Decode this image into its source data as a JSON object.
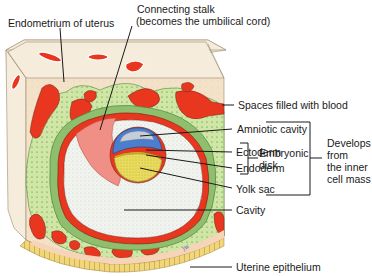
{
  "diagram": {
    "type": "anatomical-cross-section",
    "colors": {
      "endometrium": "#f3e1c8",
      "block_top": "#f5ecdc",
      "blood": "#e8361f",
      "green_light": "#cfe6a4",
      "green_dark": "#8fbf6c",
      "amnion": "#4a7fd0",
      "amniotic_fluid": "#c7cdd6",
      "yolk": "#e9dc5c",
      "cavity": "#f2f4f0",
      "stalk_pink": "#f08f86",
      "epithelium": "#f2d67a",
      "line": "#1a1a1a"
    }
  },
  "labels": {
    "endometrium": "Endometrium of uterus",
    "connecting_stalk_line1": "Connecting stalk",
    "connecting_stalk_line2": "(becomes the umbilical cord)",
    "spaces_blood": "Spaces filled with blood",
    "amniotic_cavity": "Amniotic cavity",
    "ectoderm": "Ectoderm",
    "endoderm": "Endoderm",
    "embryonic_disk_line1": "Embryonic",
    "embryonic_disk_line2": "disk",
    "yolk_sac": "Yolk sac",
    "cavity": "Cavity",
    "uterine_epithelium": "Uterine epithelium",
    "develops_line1": "Develops",
    "develops_line2": "from",
    "develops_line3": "the inner",
    "develops_line4": "cell mass"
  }
}
